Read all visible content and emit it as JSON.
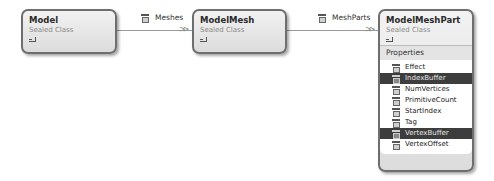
{
  "diagram": {
    "type": "class-diagram",
    "classes": [
      {
        "name": "Model",
        "stereotype": "Sealed Class"
      },
      {
        "name": "ModelMesh",
        "stereotype": "Sealed Class"
      },
      {
        "name": "ModelMeshPart",
        "stereotype": "Sealed Class",
        "sections": [
          {
            "header": "Properties",
            "members": [
              {
                "name": "Effect",
                "selected": false
              },
              {
                "name": "IndexBuffer",
                "selected": true
              },
              {
                "name": "NumVertices",
                "selected": false
              },
              {
                "name": "PrimitiveCount",
                "selected": false
              },
              {
                "name": "StartIndex",
                "selected": false
              },
              {
                "name": "Tag",
                "selected": false
              },
              {
                "name": "VertexBuffer",
                "selected": true
              },
              {
                "name": "VertexOffset",
                "selected": false
              }
            ]
          }
        ]
      }
    ],
    "associations": [
      {
        "from": "Model",
        "to": "ModelMesh",
        "label": "Meshes",
        "icon": "property-icon"
      },
      {
        "from": "ModelMesh",
        "to": "ModelMeshPart",
        "label": "MeshParts",
        "icon": "property-icon"
      }
    ],
    "arrow_glyph": ">>",
    "colors": {
      "border": "#6e6e6e",
      "selected_row": "#3d3d3d",
      "connector": "#9a9a9a"
    }
  }
}
